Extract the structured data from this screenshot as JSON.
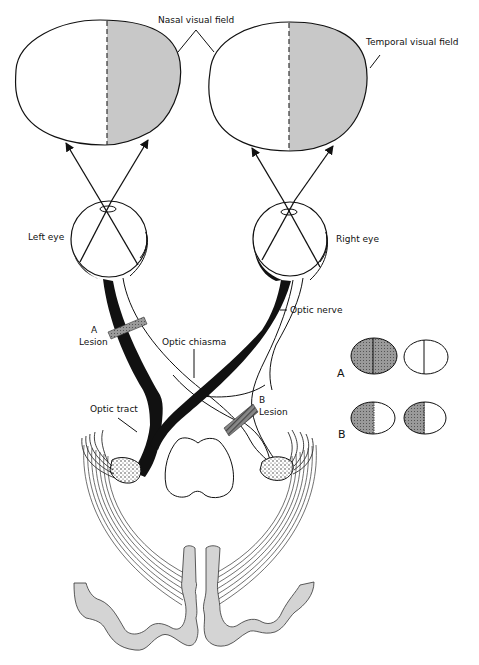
{
  "diagram": {
    "labels": {
      "nasal_visual_field": "Nasal visual field",
      "temporal_visual_field": "Temporal visual field",
      "left_eye": "Left eye",
      "right_eye": "Right eye",
      "optic_nerve": "Optic nerve",
      "optic_chiasma": "Optic chiasma",
      "optic_tract": "Optic tract",
      "lesion_a_letter": "A",
      "lesion_a_word": "Lesion",
      "lesion_b_letter": "B",
      "lesion_b_word": "Lesion"
    },
    "defects_legend": {
      "row_a_label": "A",
      "row_b_label": "B"
    },
    "colors": {
      "field_shade": "#c8c8c8",
      "defect_shade": "#8a8a8a",
      "cortex_shade": "#d4d4d4",
      "stroke": "#111111"
    }
  }
}
